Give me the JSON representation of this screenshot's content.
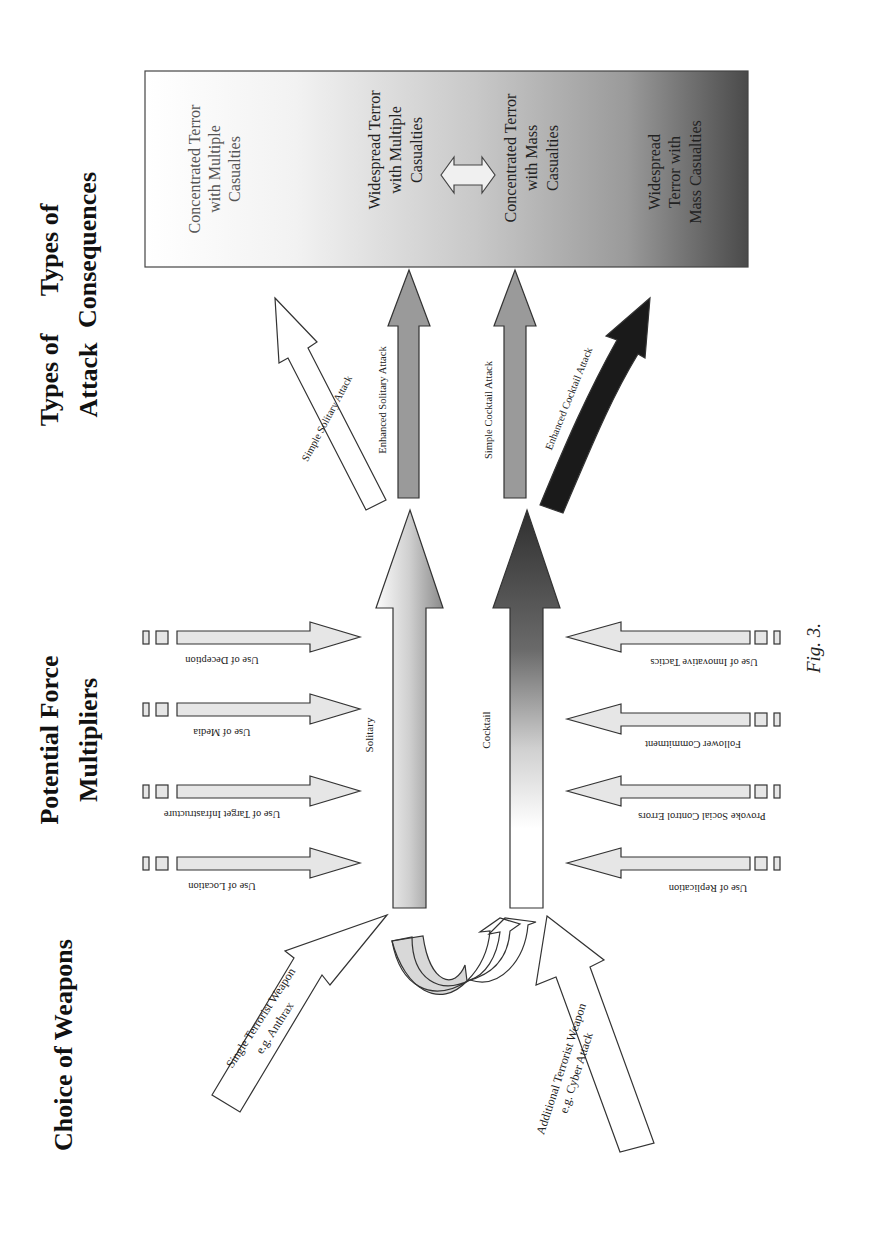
{
  "figure": {
    "caption": "Fig. 3.",
    "orientation": "rotated 90deg counter-clockwise (landscape page)"
  },
  "columns": {
    "weapons": "Choice of Weapons",
    "multipliers_line1": "Potential Force",
    "multipliers_line2": "Multipliers",
    "attack_line1": "Types of",
    "attack_line2": "Attack",
    "consequences_line1": "Types of",
    "consequences_line2": "Consequences"
  },
  "weapons": {
    "single_line1": "Single Terrorist Weapon",
    "single_line2": "e.g. Anthrax",
    "additional_line1": "Additional Terrorist Weapon",
    "additional_line2": "e.g. Cyber Attack"
  },
  "paths": {
    "solitary": "Solitary",
    "cocktail": "Cocktail"
  },
  "multipliers": {
    "solitary_side": [
      {
        "label": "Use of Location"
      },
      {
        "label": "Use of Target Infrastructure"
      },
      {
        "label": "Use of Media"
      },
      {
        "label": "Use of Deception"
      }
    ],
    "cocktail_side": [
      {
        "label": "Use of Replication"
      },
      {
        "label": "Provoke Social Control Errors"
      },
      {
        "label": "Follower Commitment"
      },
      {
        "label": "Use of Innovative Tactics"
      }
    ]
  },
  "attacks": {
    "simple_solitary": "Simple Solitary Attack",
    "enhanced_solitary": "Enhanced Solitary Attack",
    "simple_cocktail": "Simple Cocktail Attack",
    "enhanced_cocktail": "Enhanced Cocktail Attack"
  },
  "consequences": {
    "c1": [
      "Concentrated Terror",
      "with Multiple",
      "Casualties"
    ],
    "c2": [
      "Widespread Terror",
      "with Multiple",
      "Casualties"
    ],
    "c3": [
      "Concentrated Terror",
      "with Mass",
      "Casualties"
    ],
    "c4": [
      "Widespread",
      "Terror with",
      "Mass  Casualties"
    ]
  },
  "colors": {
    "arrow_light": "#e6e6e6",
    "arrow_mid": "#9a9a9a",
    "arrow_dark": "#1a1a1a",
    "box_gradient_start": "#ffffff",
    "box_gradient_end": "#4a4a4a"
  }
}
